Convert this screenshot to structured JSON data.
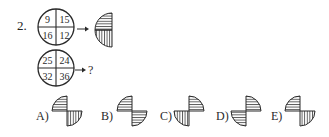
{
  "question": {
    "number": "2.",
    "example": {
      "circle_values": [
        "9",
        "15",
        "16",
        "12"
      ],
      "arrow": "→",
      "result_shape": {
        "type": "left-half-circle",
        "top_left_fill": "horizontal-lines",
        "bottom_left_fill": "vertical-lines"
      }
    },
    "query": {
      "circle_values": [
        "25",
        "24",
        "32",
        "36"
      ],
      "arrow": "→",
      "unknown": "?"
    }
  },
  "options": [
    {
      "label": "A)",
      "top_quadrant": "top-left",
      "top_fill": "horizontal",
      "bottom_quadrant": "bottom-right",
      "bottom_fill": "vertical"
    },
    {
      "label": "B)",
      "top_quadrant": "top-left",
      "top_fill": "horizontal",
      "bottom_quadrant": "bottom-right",
      "bottom_fill": "horizontal"
    },
    {
      "label": "C)",
      "top_quadrant": "top-right",
      "top_fill": "horizontal",
      "bottom_quadrant": "bottom-left",
      "bottom_fill": "vertical"
    },
    {
      "label": "D)",
      "top_quadrant": "top-right",
      "top_fill": "horizontal",
      "bottom_quadrant": "bottom-left",
      "bottom_fill": "horizontal"
    },
    {
      "label": "E)",
      "top_quadrant": "top-left",
      "top_fill": "horizontal",
      "bottom_quadrant": "bottom-right",
      "bottom_fill": "vertical"
    }
  ],
  "colors": {
    "ink": "#2a2a2a",
    "background": "#ffffff"
  }
}
